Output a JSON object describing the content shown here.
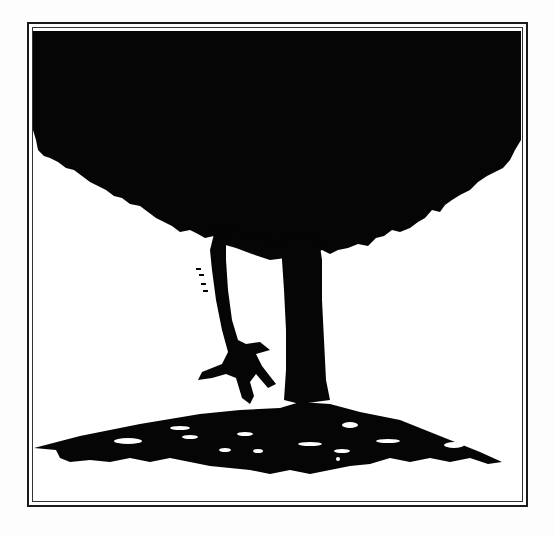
{
  "artwork": {
    "alt": "Silhouette of a large tree with a figure hanging from a branch above a mound of ground",
    "colors": {
      "ink": "#050505",
      "paper": "#ffffff",
      "frame": "#1a1a1a"
    }
  }
}
